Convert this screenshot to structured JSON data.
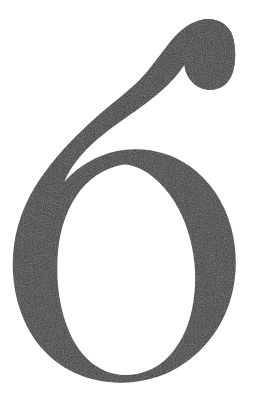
{
  "image": {
    "kind": "glyph-specimen",
    "subject": "numeral-six",
    "character": "6",
    "alt_text": "Large serif numeral 6",
    "width": 253,
    "height": 408
  },
  "colors": {
    "background": "#ffffff",
    "ink": "#3e3c3c",
    "ink_shadow": "#2f2d2d",
    "grain": "#6a6666"
  },
  "glyph": {
    "label": "6",
    "style": "didone-serif-lining-figure",
    "bounds": {
      "x_min": 13,
      "y_min": 18,
      "x_max": 236,
      "y_max": 382
    },
    "counter": {
      "x_min": 63,
      "y_min": 152,
      "x_max": 188,
      "y_max": 372
    },
    "terminal": {
      "type": "ball-terminal",
      "x": 232,
      "y": 55
    },
    "stroke_contrast": "high"
  },
  "paths": {
    "body": "M231.5 33.0 C226.0 22.5 214.5 17.5 203.0 19.5 C190.5 21.6 180.0 30.0 170.5 41.5 C160.0 54.5 150.5 69.0 139.0 80.5 C126.0 93.5 111.0 104.0 97.0 116.5 C78.5 133.0 60.5 151.0 45.0 172.0 C29.0 193.5 17.5 218.5 14.0 245.5 C10.0 276.0 15.5 307.5 31.0 333.5 C46.0 358.5 70.5 375.0 98.5 380.5 C125.0 385.7 153.5 381.5 177.0 368.0 C200.5 354.5 218.5 332.5 228.0 307.0 C237.5 281.5 238.0 253.0 231.0 227.0 C224.5 202.5 210.0 180.5 189.5 166.0 C170.5 152.5 146.5 147.0 123.5 150.0 C104.0 152.5 86.0 161.5 71.5 174.5 C69.0 176.8 66.6 179.2 64.3 181.8 C70.0 168.0 79.5 156.0 90.5 145.5 C104.0 132.5 120.0 122.0 135.5 111.0 C151.0 100.0 166.5 88.0 178.5 73.0 C183.5 66.5 188.0 59.5 193.5 54.0 C199.5 48.0 207.0 44.0 215.5 45.0 C222.0 45.8 227.5 49.5 231.0 55.0 C234.5 60.5 235.0 67.5 232.5 73.5 C236.0 62.0 236.5 46.5 231.5 33.0 Z",
    "bowl_counter": "M124.0 164.5 C104.0 167.5 87.0 179.5 76.0 196.5 C64.0 214.5 58.5 236.5 57.5 258.5 C56.3 284.0 59.5 310.0 70.0 333.5 C78.5 352.5 93.0 368.5 113.0 373.5 C131.5 378.0 151.0 372.5 165.0 360.0 C179.5 347.0 188.0 328.5 192.0 309.5 C197.0 285.5 196.0 260.0 189.5 236.5 C183.0 213.0 170.5 190.0 150.5 175.0 C142.5 169.0 133.5 165.0 124.0 164.5 Z",
    "terminal_ball": "M203.0 19.5 C214.5 17.5 226.0 22.5 231.5 33.0 C236.5 46.5 236.0 62.0 232.5 73.5 C229.0 84.0 220.0 90.5 209.0 90.0 C198.5 89.5 189.5 82.0 186.0 72.5 C182.0 61.5 185.0 48.5 192.0 39.0 C195.0 34.8 198.8 31.0 203.0 27.5 Z"
  },
  "labels": {
    "canvas": "glyph-canvas",
    "figure_caption": "6"
  }
}
